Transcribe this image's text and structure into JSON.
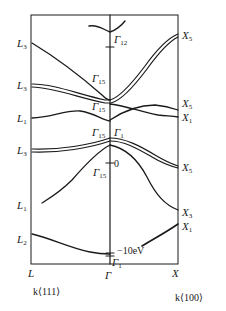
{
  "diagram": {
    "type": "band-structure",
    "left_direction": {
      "point": "L",
      "axis_label": "k⟨111⟩"
    },
    "center_point": "Γ",
    "right_direction": {
      "point": "X",
      "axis_label": "k⟨100⟩"
    },
    "left_labels": [
      {
        "base": "L",
        "sub": "3"
      },
      {
        "base": "L",
        "sub": "3"
      },
      {
        "base": "L",
        "sub": "1"
      },
      {
        "base": "L",
        "sub": "3"
      },
      {
        "base": "L",
        "sub": "1"
      },
      {
        "base": "L",
        "sub": "2"
      }
    ],
    "right_labels": [
      {
        "base": "X",
        "sub": "5"
      },
      {
        "base": "X",
        "sub": "5"
      },
      {
        "base": "X",
        "sub": "1"
      },
      {
        "base": "X",
        "sub": "5"
      },
      {
        "base": "X",
        "sub": "3"
      },
      {
        "base": "X",
        "sub": "1"
      }
    ],
    "gamma_labels": [
      {
        "base": "Γ",
        "sub": "12"
      },
      {
        "base": "Γ",
        "sub": "15"
      },
      {
        "base": "Γ",
        "sub": "15"
      },
      {
        "base": "Γ",
        "sub": "15"
      },
      {
        "base": "Γ",
        "sub": "1"
      },
      {
        "base": "Γ",
        "sub": "15"
      },
      {
        "base": "Γ",
        "sub": "1"
      }
    ],
    "energy_markers": {
      "zero": "0",
      "bottom": "−10eV"
    },
    "axis_points": {
      "L": "L",
      "gamma": "Γ",
      "X": "X"
    },
    "line_color": "#1a1a1a"
  }
}
